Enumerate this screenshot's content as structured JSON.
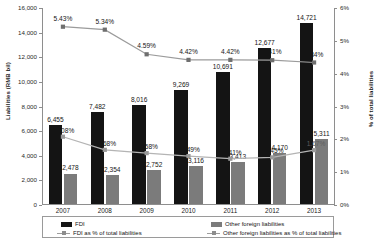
{
  "chart_data": {
    "type": "bar",
    "title": "",
    "categories": [
      "2007",
      "2008",
      "2009",
      "2010",
      "2011",
      "2012",
      "2013"
    ],
    "xlabel": "",
    "ylabel": "Liabilities (RMB bil)",
    "ylabel_right": "% of total liabilities",
    "ylim": [
      0,
      16000
    ],
    "yticks": [
      "0",
      "2,000",
      "4,000",
      "6,000",
      "8,000",
      "10,000",
      "12,000",
      "14,000",
      "16,000"
    ],
    "ylim_right": [
      0,
      6
    ],
    "yticks_right": [
      "0%",
      "1%",
      "2%",
      "3%",
      "4%",
      "5%",
      "6%"
    ],
    "grid": false,
    "legend_position": "bottom",
    "series": [
      {
        "name": "FDI",
        "type": "bar",
        "axis": "left",
        "color": "#141414",
        "values": [
          6455,
          7482,
          8016,
          9269,
          10691,
          12677,
          14721
        ],
        "labels": [
          "6,455",
          "7,482",
          "8,016",
          "9,269",
          "10,691",
          "12,677",
          "14,721"
        ]
      },
      {
        "name": "Other foreign liabilities",
        "type": "bar",
        "axis": "left",
        "color": "#7b7b7b",
        "values": [
          2478,
          2354,
          2752,
          3116,
          3413,
          4170,
          5311
        ],
        "labels": [
          "2,478",
          "2,354",
          "2,752",
          "3,116",
          "3,413",
          "4,170",
          "5,311"
        ]
      },
      {
        "name": "FDI as % of total liabilities",
        "type": "line",
        "axis": "right",
        "color": "#9d9d9d",
        "values": [
          5.43,
          5.34,
          4.59,
          4.42,
          4.42,
          4.41,
          4.34
        ],
        "labels": [
          "5.43%",
          "5.34%",
          "4.59%",
          "4.42%",
          "4.42%",
          "4.41%",
          "4.34%"
        ]
      },
      {
        "name": "Other foreign liabilities as % of total liabilities",
        "type": "line",
        "axis": "right",
        "color": "#b0b0b0",
        "values": [
          2.08,
          1.68,
          1.58,
          1.49,
          1.41,
          1.45,
          1.67
        ],
        "labels": [
          "2.08%",
          "1.68%",
          "1.58%",
          "1.49%",
          "1.41%",
          "1.45%",
          "1.67%"
        ]
      }
    ]
  },
  "legend": {
    "items": [
      "FDI",
      "Other foreign liabilities",
      "FDI as % of total liabilities",
      "Other foreign liabilities as % of total liabilities"
    ]
  }
}
